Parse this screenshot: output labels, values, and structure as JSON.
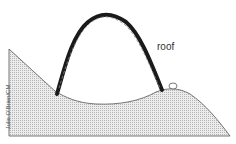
{
  "diagram": {
    "labels": {
      "roof": "roof",
      "credit": "Julie O'Brien/CM"
    },
    "colors": {
      "ground_fill": "#d9d9d9",
      "ground_stroke": "#444444",
      "arch_stroke": "#1a1a1a"
    }
  }
}
